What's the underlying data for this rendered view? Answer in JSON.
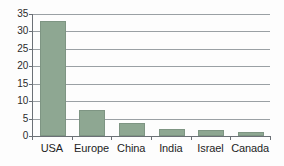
{
  "chart_data": {
    "type": "bar",
    "title": "",
    "subtitle": "",
    "xlabel": "",
    "ylabel": "",
    "categories": [
      "USA",
      "Europe",
      "China",
      "India",
      "Israel",
      "Canada"
    ],
    "values": [
      33.1,
      7.4,
      3.7,
      2.0,
      1.8,
      1.2
    ],
    "series": [
      {
        "name": "",
        "values": [
          33.1,
          7.4,
          3.7,
          2.0,
          1.8,
          1.2
        ]
      }
    ],
    "ylim": [
      0,
      35
    ],
    "ytick_labels": [
      "0",
      "5",
      "10",
      "15",
      "20",
      "25",
      "30",
      "35"
    ],
    "ytick_values": [
      0,
      5,
      10,
      15,
      20,
      25,
      30,
      35
    ],
    "grid": true,
    "grid_axis": "y",
    "legend": false,
    "legend_position": "none",
    "colors": {
      "bar_fill": "#8ea792",
      "bar_edge": "#7e9583",
      "gridline": "#9aa0a4",
      "axis": "#6b7076",
      "text": "#1d1d1d",
      "background": "#fdfdfd"
    }
  }
}
